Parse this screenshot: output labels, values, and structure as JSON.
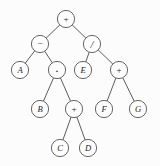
{
  "figure": {
    "background_color": "#fcfcfc",
    "node_fill_color": "#fdfdfd",
    "node_stroke_color": "#555555",
    "edge_color": "#4a4a4a",
    "label_color": "#262626",
    "node_radius": 8.6
  },
  "tree": {
    "nodes": [
      {
        "id": "n0",
        "label": "+",
        "kind": "operator",
        "x": 66,
        "y": 19,
        "level": 0
      },
      {
        "id": "n1",
        "label": "−",
        "kind": "operator",
        "x": 40,
        "y": 44,
        "level": 1
      },
      {
        "id": "n2",
        "label": "/",
        "kind": "operator",
        "x": 92,
        "y": 44,
        "level": 1
      },
      {
        "id": "n3",
        "label": "A",
        "kind": "operand",
        "x": 20,
        "y": 70,
        "level": 2
      },
      {
        "id": "n4",
        "label": "·",
        "kind": "operator",
        "x": 57,
        "y": 70,
        "level": 2
      },
      {
        "id": "n5",
        "label": "E",
        "kind": "operand",
        "x": 83,
        "y": 70,
        "level": 2
      },
      {
        "id": "n6",
        "label": "+",
        "kind": "operator",
        "x": 119,
        "y": 70,
        "level": 2
      },
      {
        "id": "n7",
        "label": "B",
        "kind": "operand",
        "x": 40,
        "y": 109,
        "level": 3
      },
      {
        "id": "n8",
        "label": "+",
        "kind": "operator",
        "x": 74,
        "y": 109,
        "level": 3
      },
      {
        "id": "n9",
        "label": "F",
        "kind": "operand",
        "x": 104,
        "y": 109,
        "level": 3
      },
      {
        "id": "n10",
        "label": "G",
        "kind": "operand",
        "x": 138,
        "y": 109,
        "level": 3
      },
      {
        "id": "n11",
        "label": "C",
        "kind": "operand",
        "x": 60,
        "y": 148,
        "level": 4
      },
      {
        "id": "n12",
        "label": "D",
        "kind": "operand",
        "x": 88,
        "y": 148,
        "level": 4
      }
    ],
    "edges": [
      {
        "from": "n0",
        "to": "n1"
      },
      {
        "from": "n0",
        "to": "n2"
      },
      {
        "from": "n1",
        "to": "n3"
      },
      {
        "from": "n1",
        "to": "n4"
      },
      {
        "from": "n2",
        "to": "n5"
      },
      {
        "from": "n2",
        "to": "n6"
      },
      {
        "from": "n4",
        "to": "n7"
      },
      {
        "from": "n4",
        "to": "n8"
      },
      {
        "from": "n6",
        "to": "n9"
      },
      {
        "from": "n6",
        "to": "n10"
      },
      {
        "from": "n8",
        "to": "n11"
      },
      {
        "from": "n8",
        "to": "n12"
      }
    ]
  }
}
